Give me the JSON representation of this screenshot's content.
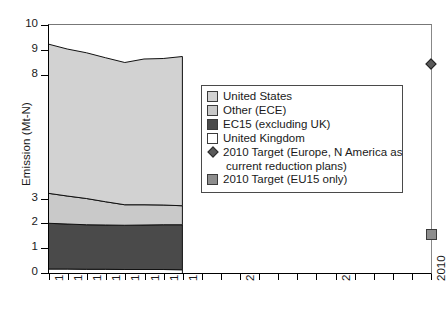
{
  "axes": {
    "ylabel": "Emission (Mt-N)",
    "ytick_labels": [
      "10",
      "9",
      "8",
      "3",
      "2",
      "1",
      "0"
    ],
    "ytick_values": [
      10,
      9,
      8,
      3,
      2,
      1,
      0
    ],
    "xtick_labels": [
      "1990",
      "1991",
      "1992",
      "1993",
      "1994",
      "1995",
      "1996",
      "1997",
      "2000",
      "2005",
      "2010"
    ],
    "xtick_values": [
      1990,
      1991,
      1992,
      1993,
      1994,
      1995,
      1996,
      1997,
      2000,
      2005,
      2010
    ],
    "ylim": [
      0,
      10
    ],
    "xlim": [
      1990,
      2010
    ],
    "grid": false
  },
  "legend": {
    "position": "inside-right",
    "items": [
      {
        "label": "United States",
        "color": "#d2d2d2",
        "marker": "square-swatch"
      },
      {
        "label": "Other (ECE)",
        "color": "#c9c9c9",
        "marker": "square-swatch"
      },
      {
        "label": "EC15 (excluding UK)",
        "color": "#4a4a4a",
        "marker": "square-swatch"
      },
      {
        "label": "United Kingdom",
        "color": "#ffffff",
        "marker": "square-swatch"
      },
      {
        "label": "2010 Target (Europe, N America as",
        "label_cont": "current reduction plans)",
        "color": "#5a5a5a",
        "marker": "diamond"
      },
      {
        "label": "2010 Target (EU15 only)",
        "color": "#8d8d8d",
        "marker": "square-swatch"
      }
    ]
  },
  "chart_data": {
    "type": "area",
    "title": "",
    "xlabel": "",
    "ylabel": "Emission (Mt-N)",
    "xlim": [
      1990,
      2010
    ],
    "ylim": [
      0,
      10
    ],
    "grid": false,
    "stacked": true,
    "x": [
      1990,
      1991,
      1992,
      1993,
      1994,
      1995,
      1996,
      1997
    ],
    "series": [
      {
        "name": "United Kingdom",
        "color": "#ffffff",
        "values": [
          0.2,
          0.2,
          0.19,
          0.19,
          0.18,
          0.18,
          0.18,
          0.17
        ]
      },
      {
        "name": "EC15 (excluding UK)",
        "color": "#4a4a4a",
        "values": [
          1.83,
          1.8,
          1.78,
          1.77,
          1.77,
          1.78,
          1.79,
          1.8
        ]
      },
      {
        "name": "Other (ECE)",
        "color": "#c9c9c9",
        "values": [
          1.2,
          1.12,
          1.05,
          0.93,
          0.82,
          0.81,
          0.79,
          0.76
        ]
      },
      {
        "name": "United States",
        "color": "#d2d2d2",
        "values": [
          5.97,
          5.88,
          5.83,
          5.76,
          5.69,
          5.83,
          5.86,
          5.97
        ]
      }
    ],
    "stack_totals": [
      9.2,
      9.0,
      8.85,
      8.65,
      8.46,
      8.6,
      8.62,
      8.7
    ],
    "markers": [
      {
        "name": "2010 Target (Europe, N America as current reduction plans)",
        "x": 2010,
        "y": 8.4,
        "shape": "diamond",
        "color": "#5a5a5a"
      },
      {
        "name": "2010 Target (EU15 only)",
        "x": 2010,
        "y": 1.55,
        "shape": "square",
        "color": "#8d8d8d"
      }
    ]
  }
}
